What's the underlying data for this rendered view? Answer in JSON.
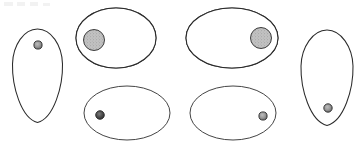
{
  "figure": {
    "background_color": "#ffffff",
    "outline_color": "#2b2b2b",
    "ray_color": "#1d1d1d",
    "hub_fill_color": "#b9b9b9",
    "pore_fill_color": "#8f8f8f",
    "canvas": {
      "width": 363,
      "height": 148
    },
    "specimen_count": 6,
    "specimens": [
      {
        "id": "specimen-1",
        "label": "upright ovoid, left",
        "shape": "ovoid-egg",
        "orientation": "upright",
        "position": "far-left",
        "cx": 37.5,
        "cy": 76,
        "rx": 25,
        "ry": 47,
        "has_rays": false,
        "pore": {
          "cx": 38,
          "cy": 45,
          "r": 4.1,
          "fill": "#9a9a9a"
        }
      },
      {
        "id": "specimen-2",
        "label": "rayed ellipse, hub left",
        "shape": "ellipse-rayed",
        "orientation": "horizontal",
        "position": "upper-mid-left",
        "cx": 116,
        "cy": 38,
        "rx": 40,
        "ry": 30,
        "has_rays": true,
        "ray_count": 13,
        "hub": {
          "cx": 94,
          "cy": 40,
          "r": 10.5,
          "fill": "#b9b9b9"
        }
      },
      {
        "id": "specimen-3",
        "label": "rayed ellipse, hub right",
        "shape": "ellipse-rayed",
        "orientation": "horizontal",
        "position": "upper-mid-right",
        "cx": 232,
        "cy": 38,
        "rx": 46,
        "ry": 30,
        "has_rays": true,
        "ray_count": 13,
        "hub": {
          "cx": 261,
          "cy": 38,
          "r": 10.5,
          "fill": "#b9b9b9"
        }
      },
      {
        "id": "specimen-4",
        "label": "plain ellipse, pore left",
        "shape": "ellipse-plain",
        "orientation": "horizontal",
        "position": "lower-mid-left",
        "cx": 127,
        "cy": 113,
        "rx": 43,
        "ry": 27,
        "has_rays": false,
        "pore": {
          "cx": 100,
          "cy": 115,
          "r": 4.3,
          "fill": "#5e5e5e"
        }
      },
      {
        "id": "specimen-5",
        "label": "plain ellipse, pore right",
        "shape": "ellipse-plain",
        "orientation": "horizontal",
        "position": "lower-mid-right",
        "cx": 233,
        "cy": 113,
        "rx": 43,
        "ry": 27,
        "has_rays": false,
        "pore": {
          "cx": 263,
          "cy": 116,
          "r": 4.1,
          "fill": "#8f8f8f"
        }
      },
      {
        "id": "specimen-6",
        "label": "upright ovoid, right",
        "shape": "ovoid-egg",
        "orientation": "upright",
        "position": "far-right",
        "cx": 327,
        "cy": 78,
        "rx": 26,
        "ry": 48,
        "has_rays": false,
        "pore": {
          "cx": 328,
          "cy": 108,
          "r": 4.2,
          "fill": "#9a9a9a"
        }
      }
    ],
    "ray_sets": {
      "left_hub_angles_deg": [
        -86,
        -71,
        -55,
        -40,
        -25,
        -11,
        2,
        14,
        28,
        44,
        60,
        76,
        92
      ],
      "right_hub_angles_deg": [
        266,
        251,
        235,
        220,
        205,
        191,
        178,
        166,
        152,
        136,
        120,
        104,
        88
      ]
    },
    "faint_top_marks": [
      {
        "x": 4,
        "y": 2,
        "w": 9,
        "h": 4
      },
      {
        "x": 17,
        "y": 2,
        "w": 8,
        "h": 4
      },
      {
        "x": 30,
        "y": 2,
        "w": 8,
        "h": 4
      },
      {
        "x": 43,
        "y": 3,
        "w": 7,
        "h": 3
      }
    ]
  }
}
